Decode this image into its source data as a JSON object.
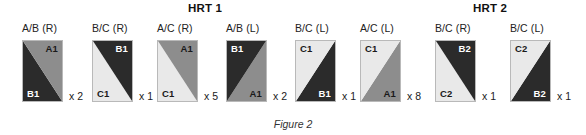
{
  "figure": {
    "caption": "Figure 2"
  },
  "groups": [
    {
      "name": "HRT 1",
      "center_x": 205
    },
    {
      "name": "HRT 2",
      "center_x": 490
    }
  ],
  "colors": {
    "fabric_a_medium_gray": "#8d8d8d",
    "fabric_b_dark": "#2b2b2b",
    "fabric_c_light": "#e9e9e9",
    "block_outline": "#b9b9b9",
    "label_dark_on_light": "#1a1a1a",
    "label_light_on_dark": "#ffffff",
    "page_background": "#ffffff"
  },
  "units": [
    {
      "label": "A/B (R)",
      "orientation": "R",
      "x": 22,
      "quantity": "x 2",
      "upper_region": {
        "code": "A1",
        "fill": "#8d8d8d",
        "text_color": "#1a1a1a",
        "corner": "top-right"
      },
      "lower_region": {
        "code": "B1",
        "fill": "#2b2b2b",
        "text_color": "#ffffff",
        "corner": "bottom-left"
      }
    },
    {
      "label": "B/C (R)",
      "orientation": "R",
      "x": 92,
      "quantity": "x 1",
      "upper_region": {
        "code": "B1",
        "fill": "#2b2b2b",
        "text_color": "#ffffff",
        "corner": "top-right"
      },
      "lower_region": {
        "code": "C1",
        "fill": "#e9e9e9",
        "text_color": "#1a1a1a",
        "corner": "bottom-left"
      }
    },
    {
      "label": "A/C (R)",
      "orientation": "R",
      "x": 157,
      "quantity": "x 5",
      "upper_region": {
        "code": "A1",
        "fill": "#8d8d8d",
        "text_color": "#1a1a1a",
        "corner": "top-right"
      },
      "lower_region": {
        "code": "C1",
        "fill": "#e9e9e9",
        "text_color": "#1a1a1a",
        "corner": "bottom-left"
      }
    },
    {
      "label": "A/B (L)",
      "orientation": "L",
      "x": 226,
      "quantity": "x 2",
      "upper_region": {
        "code": "B1",
        "fill": "#2b2b2b",
        "text_color": "#ffffff",
        "corner": "top-left"
      },
      "lower_region": {
        "code": "A1",
        "fill": "#8d8d8d",
        "text_color": "#1a1a1a",
        "corner": "bottom-right"
      }
    },
    {
      "label": "B/C (L)",
      "orientation": "L",
      "x": 295,
      "quantity": "x 1",
      "upper_region": {
        "code": "C1",
        "fill": "#e9e9e9",
        "text_color": "#1a1a1a",
        "corner": "top-left"
      },
      "lower_region": {
        "code": "B1",
        "fill": "#2b2b2b",
        "text_color": "#ffffff",
        "corner": "bottom-right"
      }
    },
    {
      "label": "A/C (L)",
      "orientation": "L",
      "x": 360,
      "quantity": "x 8",
      "upper_region": {
        "code": "C1",
        "fill": "#e9e9e9",
        "text_color": "#1a1a1a",
        "corner": "top-left"
      },
      "lower_region": {
        "code": "A1",
        "fill": "#8d8d8d",
        "text_color": "#1a1a1a",
        "corner": "bottom-right"
      }
    },
    {
      "label": "B/C (R)",
      "orientation": "R",
      "x": 435,
      "quantity": "x 1",
      "upper_region": {
        "code": "B2",
        "fill": "#2b2b2b",
        "text_color": "#ffffff",
        "corner": "top-right"
      },
      "lower_region": {
        "code": "C2",
        "fill": "#e9e9e9",
        "text_color": "#1a1a1a",
        "corner": "bottom-left"
      }
    },
    {
      "label": "B/C (L)",
      "orientation": "L",
      "x": 510,
      "quantity": "x 1",
      "upper_region": {
        "code": "C2",
        "fill": "#e9e9e9",
        "text_color": "#1a1a1a",
        "corner": "top-left"
      },
      "lower_region": {
        "code": "B2",
        "fill": "#2b2b2b",
        "text_color": "#ffffff",
        "corner": "bottom-right"
      }
    }
  ]
}
